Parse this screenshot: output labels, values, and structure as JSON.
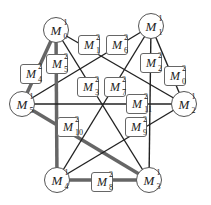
{
  "diagram": {
    "colors": {
      "edge": "#222222",
      "thick_edge": "#666666",
      "border": "#555555"
    },
    "nodes": [
      {
        "id": "M1_0",
        "base": "M",
        "sup": "1",
        "sub": "0",
        "x": 56,
        "y": 30
      },
      {
        "id": "M1_1",
        "base": "M",
        "sup": "1",
        "sub": "1",
        "x": 151,
        "y": 26
      },
      {
        "id": "M1_2",
        "base": "M",
        "sup": "1",
        "sub": "2",
        "x": 184,
        "y": 104
      },
      {
        "id": "M1_3",
        "base": "M",
        "sup": "1",
        "sub": "3",
        "x": 149,
        "y": 180
      },
      {
        "id": "M1_4",
        "base": "M",
        "sup": "1",
        "sub": "4",
        "x": 57,
        "y": 180
      },
      {
        "id": "M1_5",
        "base": "M",
        "sup": "1",
        "sub": "5",
        "x": 22,
        "y": 104
      }
    ],
    "boxes": [
      {
        "id": "M2_0",
        "base": "M",
        "sup": "2",
        "sub": "0",
        "x": 175,
        "y": 76
      },
      {
        "id": "M2_1",
        "base": "M",
        "sup": "2",
        "sub": "1",
        "x": 89,
        "y": 45
      },
      {
        "id": "M2_2",
        "base": "M",
        "sup": "2",
        "sub": "2",
        "x": 151,
        "y": 63
      },
      {
        "id": "M2_3",
        "base": "M",
        "sup": "2",
        "sub": "3",
        "x": 88,
        "y": 87
      },
      {
        "id": "M2_4",
        "base": "M",
        "sup": "2",
        "sub": "4",
        "x": 31,
        "y": 74
      },
      {
        "id": "M2_5",
        "base": "M",
        "sup": "2",
        "sub": "5",
        "x": 57,
        "y": 64
      },
      {
        "id": "M2_6",
        "base": "M",
        "sup": "2",
        "sub": "6",
        "x": 117,
        "y": 45
      },
      {
        "id": "M2_7",
        "base": "M",
        "sup": "2",
        "sub": "7",
        "x": 115,
        "y": 87
      },
      {
        "id": "M2_8",
        "base": "M",
        "sup": "2",
        "sub": "8",
        "x": 102,
        "y": 182
      },
      {
        "id": "M2_9",
        "base": "M",
        "sup": "2",
        "sub": "9",
        "x": 136,
        "y": 127
      },
      {
        "id": "M2_10",
        "base": "M",
        "sup": "2",
        "sub": "10",
        "x": 68,
        "y": 127
      },
      {
        "id": "M2_11",
        "base": "M",
        "sup": "2",
        "sub": "11",
        "x": 137,
        "y": 104
      }
    ],
    "edges": [
      {
        "from": "M1_0",
        "to": "M1_2",
        "thick": false
      },
      {
        "from": "M1_1",
        "to": "M1_5",
        "thick": false
      },
      {
        "from": "M1_0",
        "to": "M1_4",
        "thick": true
      },
      {
        "from": "M1_0",
        "to": "M1_5",
        "thick": true
      },
      {
        "from": "M1_1",
        "to": "M1_3",
        "thick": false
      },
      {
        "from": "M1_1",
        "to": "M1_2",
        "thick": false
      },
      {
        "from": "M1_5",
        "to": "M1_2",
        "thick": false
      },
      {
        "from": "M1_5",
        "to": "M1_3",
        "thick": true
      },
      {
        "from": "M1_4",
        "to": "M1_3",
        "thick": true
      },
      {
        "from": "M1_2",
        "to": "M1_4",
        "thick": false
      },
      {
        "from": "M1_0",
        "to": "M1_3",
        "thick": false
      },
      {
        "from": "M1_1",
        "to": "M1_4",
        "thick": false
      }
    ]
  }
}
